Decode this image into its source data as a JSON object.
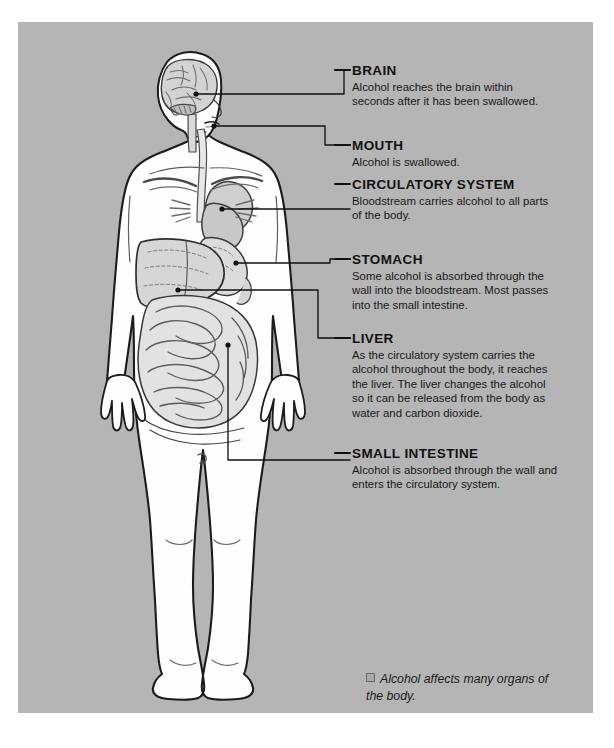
{
  "page": {
    "background_color": "#b5b5b5",
    "margin_color": "#ffffff",
    "text_color": "#17171a"
  },
  "callouts": [
    {
      "id": "brain",
      "heading": "BRAIN",
      "body": "Alcohol reaches the brain within seconds after it has been swallowed."
    },
    {
      "id": "mouth",
      "heading": "MOUTH",
      "body": "Alcohol is swallowed."
    },
    {
      "id": "circulatory",
      "heading": "CIRCULATORY SYSTEM",
      "body": "Bloodstream carries alcohol to all parts of the body."
    },
    {
      "id": "stomach",
      "heading": "STOMACH",
      "body": "Some alcohol is absorbed through the wall into the bloodstream. Most passes into the small intestine."
    },
    {
      "id": "liver",
      "heading": "LIVER",
      "body": "As the circulatory system carries the alcohol throughout the body, it reaches the liver. The liver changes the alcohol so it can be released from the body as water and carbon dioxide."
    },
    {
      "id": "small-intestine",
      "heading": "SMALL INTESTINE",
      "body": "Alcohol is absorbed through the wall and enters the circulatory system."
    }
  ],
  "caption": {
    "marker": "square-bullet-icon",
    "text": "Alcohol affects many organs of the body."
  },
  "illustration": {
    "name": "human-body-alcohol-pathway-diagram",
    "description": "Front view outline of a human figure showing the brain in the head, the mouth, the circulatory system at the heart, the stomach, the liver and the small intestine, each connected to a labeled callout by a leader line.",
    "organs": [
      "brain",
      "mouth",
      "heart-circulatory-system",
      "stomach",
      "liver",
      "small-intestine"
    ],
    "body_fill": "#fefefe",
    "organ_fill": "#dcdcdc",
    "outline_color": "#1c1c1c"
  }
}
